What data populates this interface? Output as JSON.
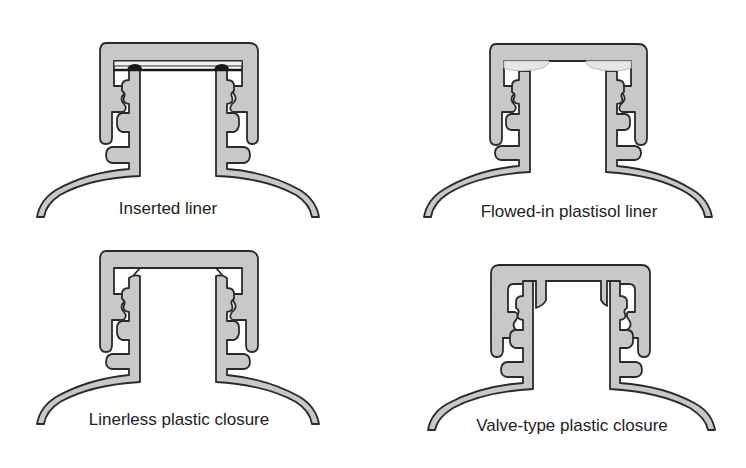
{
  "figure": {
    "colors": {
      "fill": "#c8c8c8",
      "outline": "#2a2a2a",
      "liner_dark": "#1a1a1a",
      "plastisol": "#e6e6e6",
      "background": "#ffffff"
    },
    "panels": [
      {
        "id": "inserted-liner",
        "label": "Inserted liner",
        "position": "top-left"
      },
      {
        "id": "flowed-in-plastisol-liner",
        "label": "Flowed-in plastisol liner",
        "position": "top-right"
      },
      {
        "id": "linerless-plastic-closure",
        "label": "Linerless plastic closure",
        "position": "bottom-left"
      },
      {
        "id": "valve-type-plastic-closure",
        "label": "Valve-type plastic closure",
        "position": "bottom-right"
      }
    ]
  }
}
